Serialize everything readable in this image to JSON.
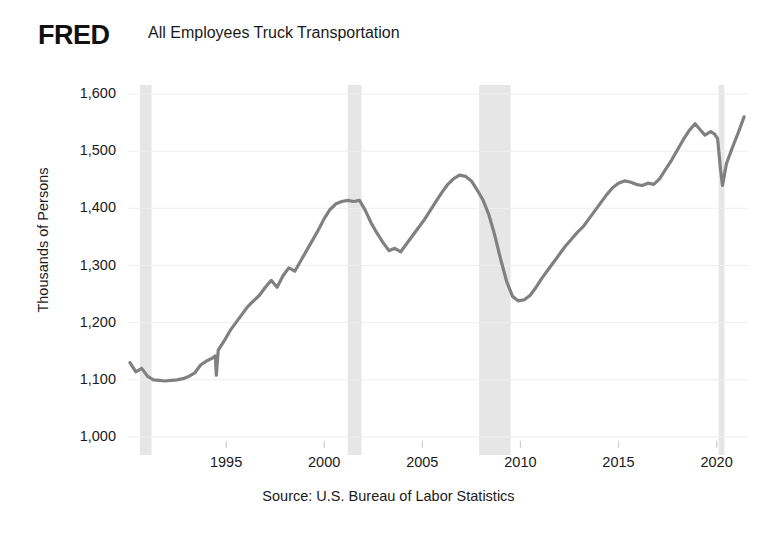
{
  "brand": {
    "logo_text": "FRED",
    "logo_color": "#111111"
  },
  "header": {
    "title": "All Employees Truck Transportation"
  },
  "footer": {
    "source": "Source: U.S. Bureau of Labor Statistics"
  },
  "colors": {
    "line": "#808080",
    "recession_band": "#e6e6e6",
    "gridline": "#eeeeee",
    "text": "#1a1a1a",
    "background": "#ffffff"
  },
  "chart_data": {
    "type": "line",
    "title": "All Employees Truck Transportation",
    "xlabel": "",
    "ylabel": "Thousands of Persons",
    "source": "Source: U.S. Bureau of Labor Statistics",
    "grid": true,
    "legend": "none",
    "xlim": [
      1990.0,
      2021.6
    ],
    "ylim": [
      1000,
      1600
    ],
    "yticks": [
      1000,
      1100,
      1200,
      1300,
      1400,
      1500,
      1600
    ],
    "ytick_labels": [
      "1,000",
      "1,100",
      "1,200",
      "1,300",
      "1,400",
      "1,500",
      "1,600"
    ],
    "xticks": [
      1995,
      2000,
      2005,
      2010,
      2015,
      2020
    ],
    "xtick_labels": [
      "1995",
      "2000",
      "2005",
      "2010",
      "2015",
      "2020"
    ],
    "units": "Thousands of Persons",
    "recession_bands": [
      {
        "start": 1990.6,
        "end": 1991.2,
        "label": "1990-91 recession"
      },
      {
        "start": 2001.2,
        "end": 2001.9,
        "label": "2001 recession"
      },
      {
        "start": 2007.9,
        "end": 2009.5,
        "label": "2007-09 recession"
      },
      {
        "start": 2020.1,
        "end": 2020.4,
        "label": "2020 recession"
      }
    ],
    "series": [
      {
        "name": "All Employees, Truck Transportation",
        "color": "#808080",
        "x": [
          1990.1,
          1990.4,
          1990.7,
          1991.0,
          1991.3,
          1991.6,
          1991.9,
          1992.2,
          1992.5,
          1992.8,
          1993.1,
          1993.4,
          1993.7,
          1994.0,
          1994.3,
          1994.45,
          1994.5,
          1994.6,
          1994.9,
          1995.2,
          1995.5,
          1995.8,
          1996.1,
          1996.4,
          1996.7,
          1997.0,
          1997.3,
          1997.6,
          1997.9,
          1998.2,
          1998.5,
          1998.8,
          1999.1,
          1999.4,
          1999.7,
          2000.0,
          2000.3,
          2000.6,
          2000.9,
          2001.2,
          2001.5,
          2001.8,
          2002.1,
          2002.4,
          2002.7,
          2003.0,
          2003.3,
          2003.6,
          2003.9,
          2004.2,
          2004.5,
          2004.8,
          2005.1,
          2005.4,
          2005.7,
          2006.0,
          2006.3,
          2006.6,
          2006.9,
          2007.2,
          2007.5,
          2007.8,
          2008.1,
          2008.4,
          2008.7,
          2009.0,
          2009.3,
          2009.6,
          2009.9,
          2010.2,
          2010.5,
          2010.8,
          2011.1,
          2011.4,
          2011.7,
          2012.0,
          2012.3,
          2012.6,
          2012.9,
          2013.2,
          2013.5,
          2013.8,
          2014.1,
          2014.4,
          2014.7,
          2015.0,
          2015.3,
          2015.6,
          2015.9,
          2016.2,
          2016.5,
          2016.8,
          2017.1,
          2017.4,
          2017.7,
          2018.0,
          2018.3,
          2018.6,
          2018.9,
          2019.1,
          2019.4,
          2019.7,
          2019.9,
          2020.05,
          2020.2,
          2020.3,
          2020.5,
          2020.8,
          2021.1,
          2021.4
        ],
        "y": [
          1130,
          1114,
          1120,
          1106,
          1100,
          1099,
          1098,
          1099,
          1100,
          1102,
          1106,
          1112,
          1126,
          1133,
          1138,
          1142,
          1108,
          1152,
          1168,
          1186,
          1200,
          1214,
          1228,
          1238,
          1248,
          1262,
          1274,
          1262,
          1282,
          1296,
          1290,
          1308,
          1326,
          1344,
          1362,
          1382,
          1398,
          1408,
          1412,
          1414,
          1412,
          1414,
          1396,
          1374,
          1356,
          1340,
          1326,
          1330,
          1324,
          1338,
          1352,
          1366,
          1380,
          1396,
          1412,
          1428,
          1442,
          1452,
          1458,
          1456,
          1448,
          1432,
          1414,
          1388,
          1352,
          1310,
          1272,
          1246,
          1238,
          1240,
          1248,
          1262,
          1278,
          1292,
          1306,
          1320,
          1334,
          1346,
          1358,
          1368,
          1382,
          1396,
          1410,
          1424,
          1436,
          1444,
          1448,
          1446,
          1442,
          1440,
          1444,
          1442,
          1452,
          1468,
          1484,
          1502,
          1520,
          1536,
          1548,
          1540,
          1528,
          1534,
          1530,
          1522,
          1468,
          1440,
          1478,
          1506,
          1532,
          1560
        ]
      }
    ],
    "annotations": [
      {
        "text": "Series begins near 1,130 in 1990",
        "value": 1130
      },
      {
        "text": "Trough near 1,098 in 1991-92",
        "value": 1098
      },
      {
        "text": "Peak near 1,414 in 2000-01",
        "value": 1414
      },
      {
        "text": "Peak near 1,458 in 2006-07",
        "value": 1458
      },
      {
        "text": "Great Recession trough near 1,238 in 2010",
        "value": 1238
      },
      {
        "text": "Pre-COVID peak near 1,548 in 2018-19",
        "value": 1548
      },
      {
        "text": "COVID trough near 1,440 in 2020",
        "value": 1440
      },
      {
        "text": "Series ends near 1,560 in 2021",
        "value": 1560
      }
    ]
  }
}
